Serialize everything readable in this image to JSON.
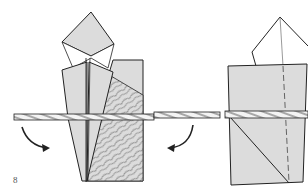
{
  "diagram": {
    "type": "origami-instruction",
    "step_number": "8",
    "panels": [
      {
        "name": "left-step",
        "description": "Folded model with patterned paper, skewer laid horizontally across, arrows showing fold around"
      },
      {
        "name": "right-step",
        "description": "Result: model wrapped around skewer with dashed valley line and diagonal crease"
      }
    ],
    "right_edge_text_fragments": [
      "-",
      "f",
      "f",
      "f",
      "..."
    ],
    "colors": {
      "paper_fill": "#dcdcdc",
      "outline": "#222222",
      "pattern": "#555555",
      "background": "#ffffff"
    }
  }
}
